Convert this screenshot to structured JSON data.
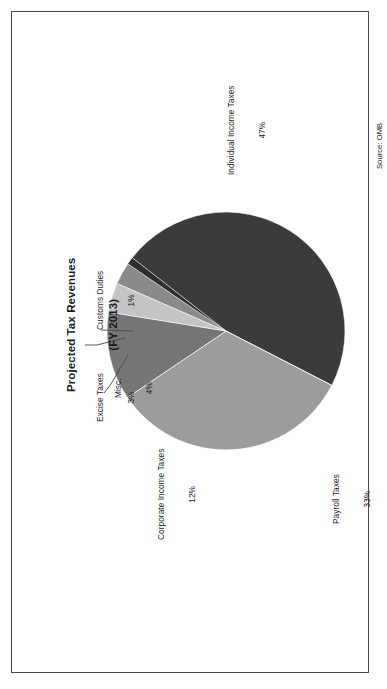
{
  "figure": {
    "title_line1": "Projected Tax Revenues",
    "title_line2": "(FY 2013)",
    "source": "Source: OMB",
    "orientation_degrees": -90,
    "frame_color": "#4a4a4a",
    "background_color": "#ffffff"
  },
  "chart_data": {
    "type": "pie",
    "title": "Projected Tax Revenues (FY 2013)",
    "subtitle": "(FY 2013)",
    "unit": "percent",
    "legend_position": "none",
    "labels_outside": true,
    "categories": [
      "Individual Income Taxes",
      "Payroll Taxes",
      "Corporate Income Taxes",
      "Misc.",
      "Excise Taxes",
      "Customs Duties"
    ],
    "values": [
      47,
      33,
      12,
      4,
      3,
      1
    ],
    "colors": [
      "#3b3b3b",
      "#9c9c9c",
      "#757575",
      "#c4c4c4",
      "#8a8a8a",
      "#2e2e2e"
    ],
    "slices": [
      {
        "name": "Individual Income Taxes",
        "value": 47,
        "label": "Individual Income Taxes",
        "value_label": "47%",
        "color": "#3b3b3b"
      },
      {
        "name": "Payroll Taxes",
        "value": 33,
        "label": "Payroll Taxes",
        "value_label": "33%",
        "color": "#9c9c9c"
      },
      {
        "name": "Corporate Income Taxes",
        "value": 12,
        "label": "Corporate Income Taxes",
        "value_label": "12%",
        "color": "#757575"
      },
      {
        "name": "Misc.",
        "value": 4,
        "label": "Misc.",
        "value_label": "4%",
        "color": "#c4c4c4"
      },
      {
        "name": "Excise Taxes",
        "value": 3,
        "label": "Excise Taxes",
        "value_label": "3%",
        "color": "#8a8a8a"
      },
      {
        "name": "Customs Duties",
        "value": 1,
        "label": "Customs Duties",
        "value_label": "1%",
        "color": "#2e2e2e"
      }
    ],
    "annotations": [
      "Source: OMB"
    ]
  }
}
